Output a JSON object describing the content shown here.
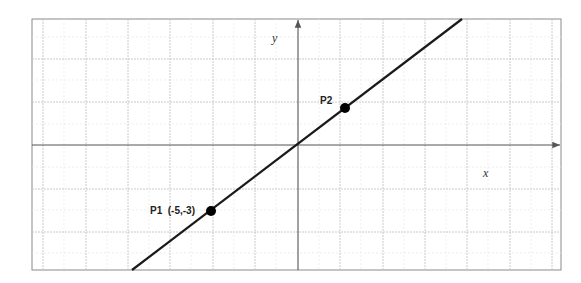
{
  "diagram": {
    "axes": {
      "x_label": "x",
      "y_label": "y"
    },
    "points": [
      {
        "name": "P1",
        "label": "P1  (-5,-3)",
        "x": -5,
        "y": -3
      },
      {
        "name": "P2",
        "label": "P2",
        "x": 3,
        "y": 1.8
      }
    ],
    "line": {
      "passes_through": [
        "P1",
        "origin",
        "P2"
      ],
      "slope": 0.6
    },
    "colors": {
      "grid_major": "#bdbdbd",
      "grid_minor": "#e3e3e3",
      "axes": "#555555",
      "line": "#1a1a1a",
      "point": "#000000",
      "frame": "#8a8a8a"
    }
  }
}
